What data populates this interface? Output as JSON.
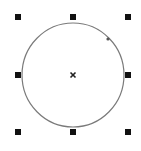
{
  "canvas": {
    "width": 141,
    "height": 151,
    "background": "#ffffff"
  },
  "ellipse": {
    "cx": 73,
    "cy": 75,
    "rx": 51,
    "ry": 52,
    "stroke": "#7a7a7a",
    "stroke_width": 1.2
  },
  "center_marker": {
    "x": 73,
    "y": 75,
    "icon": "x-cross-icon",
    "color": "#222222"
  },
  "node": {
    "x": 108,
    "y": 39,
    "r": 1.6,
    "color": "#555555"
  },
  "handles": {
    "size": 6,
    "color": "#111111",
    "items": [
      {
        "name": "handle-top-left",
        "x": 18,
        "y": 17
      },
      {
        "name": "handle-top-middle",
        "x": 73,
        "y": 17
      },
      {
        "name": "handle-top-right",
        "x": 128,
        "y": 17
      },
      {
        "name": "handle-middle-left",
        "x": 18,
        "y": 75
      },
      {
        "name": "handle-middle-right",
        "x": 128,
        "y": 75
      },
      {
        "name": "handle-bottom-left",
        "x": 18,
        "y": 132
      },
      {
        "name": "handle-bottom-middle",
        "x": 73,
        "y": 132
      },
      {
        "name": "handle-bottom-right",
        "x": 128,
        "y": 132
      }
    ]
  }
}
